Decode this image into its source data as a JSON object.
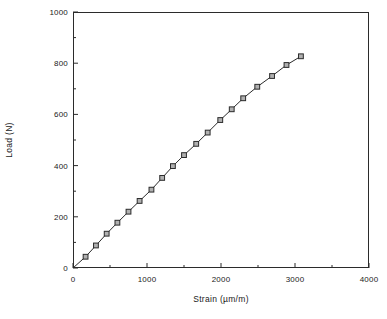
{
  "chart_data": {
    "type": "line",
    "title": "",
    "xlabel": "Strain (µm/m)",
    "ylabel": "Load  (N)",
    "xlim": [
      0,
      4000
    ],
    "ylim": [
      0,
      1000
    ],
    "xticks": [
      0,
      1000,
      2000,
      3000,
      4000
    ],
    "xtick_labels": [
      "0",
      "1000",
      "2000",
      "3000",
      "4000"
    ],
    "yticks": [
      0,
      200,
      400,
      600,
      800,
      1000
    ],
    "ytick_labels": [
      "0",
      "200",
      "400",
      "600",
      "800",
      "1000"
    ],
    "x_minor_tick_interval": 500,
    "y_minor_tick_interval": 100,
    "grid": false,
    "legend": null,
    "marker": "open-square",
    "line_color": "#2b2b2b",
    "marker_face_color": "#b0b0b0",
    "marker_edge_color": "#2b2b2b",
    "series": [
      {
        "name": "Load vs Strain",
        "x": [
          0,
          170,
          310,
          455,
          600,
          750,
          900,
          1060,
          1205,
          1350,
          1500,
          1665,
          1820,
          1990,
          2145,
          2300,
          2490,
          2690,
          2885,
          3080
        ],
        "y": [
          0,
          44,
          88,
          134,
          177,
          220,
          262,
          306,
          352,
          398,
          441,
          485,
          529,
          578,
          620,
          663,
          708,
          750,
          793,
          827
        ]
      }
    ]
  },
  "figure": {
    "background_color": "#ffffff",
    "axis_color": "#2b2b2b"
  }
}
